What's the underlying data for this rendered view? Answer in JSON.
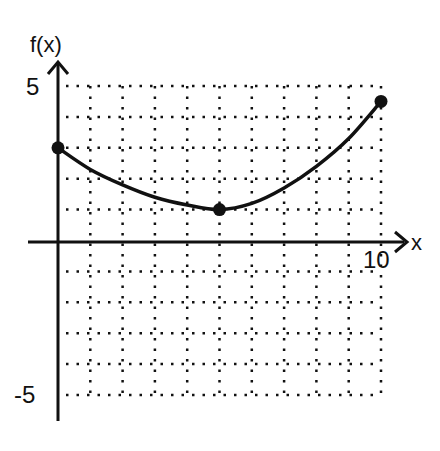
{
  "chart_data": {
    "type": "line",
    "title": "",
    "xlabel": "x",
    "ylabel": "f(x)",
    "xlim": [
      0,
      10
    ],
    "ylim": [
      -5,
      5
    ],
    "grid": true,
    "grid_style": "dotted",
    "x_ticks_labeled": [
      "10"
    ],
    "y_ticks_labeled": [
      "5",
      "-5"
    ],
    "series": [
      {
        "name": "f(x)",
        "description": "smooth curve decreasing from (0,3) to minimum near (5,1), then increasing to (10,4.5)",
        "points": [
          {
            "x": 0,
            "y": 3
          },
          {
            "x": 1,
            "y": 2.3
          },
          {
            "x": 2,
            "y": 1.8
          },
          {
            "x": 3,
            "y": 1.4
          },
          {
            "x": 4,
            "y": 1.15
          },
          {
            "x": 5,
            "y": 1
          },
          {
            "x": 6,
            "y": 1.2
          },
          {
            "x": 7,
            "y": 1.7
          },
          {
            "x": 8,
            "y": 2.4
          },
          {
            "x": 9,
            "y": 3.3
          },
          {
            "x": 10,
            "y": 4.5
          }
        ],
        "marked_points": [
          {
            "x": 0,
            "y": 3
          },
          {
            "x": 5,
            "y": 1
          },
          {
            "x": 10,
            "y": 4.5
          }
        ]
      }
    ]
  },
  "labels": {
    "y_axis": "f(x)",
    "x_axis": "x",
    "y_max": "5",
    "y_min": "-5",
    "x_max": "10"
  }
}
